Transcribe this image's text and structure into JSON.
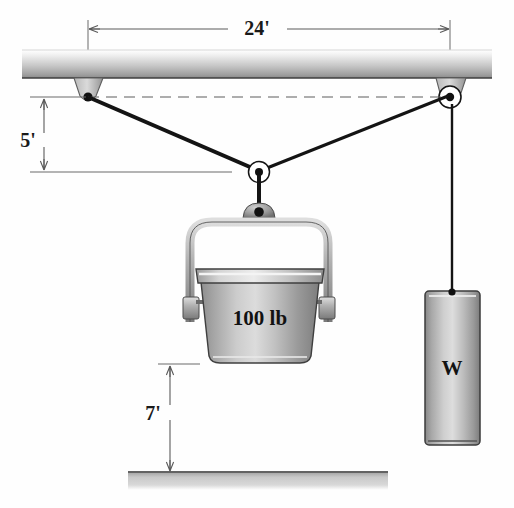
{
  "figure": {
    "type": "engineering-free-body-diagram",
    "background_color": "#fefefe"
  },
  "dimensions": {
    "span": {
      "label": "24'",
      "value": 24,
      "unit": "ft",
      "orientation": "horizontal",
      "from": "left-anchor",
      "to": "right-pulley"
    },
    "sag": {
      "label": "5'",
      "value": 5,
      "unit": "ft",
      "orientation": "vertical",
      "from": "anchor-level",
      "to": "center-pulley-level"
    },
    "clearance": {
      "label": "7'",
      "value": 7,
      "unit": "ft",
      "orientation": "vertical",
      "from": "bucket-bottom",
      "to": "ground"
    }
  },
  "labels": {
    "bucket_weight": "100 lb",
    "counterweight": "W"
  },
  "colors": {
    "beam_light": "#f2f2f2",
    "beam_dark": "#9a9a9a",
    "metal_light": "#e8e8e8",
    "metal_mid": "#9d9d9d",
    "metal_dark": "#6e6e6e",
    "cable": "#141414",
    "ground": "#b8b8b8",
    "dimension_line": "#5a5a5a",
    "text": "#1a1a1a"
  },
  "components": {
    "ceiling_beam": {
      "name": "ceiling beam",
      "y_top": 50,
      "y_bottom": 78
    },
    "left_anchor": {
      "name": "left anchor bracket",
      "x": 88,
      "y": 97
    },
    "right_pulley": {
      "name": "right pulley",
      "x": 450,
      "y": 97
    },
    "center_pulley": {
      "name": "center pulley",
      "x": 259,
      "y": 172
    },
    "bucket": {
      "name": "bucket",
      "label": "100 lb",
      "x_left": 195,
      "x_right": 325,
      "y_top": 268,
      "y_bottom": 363
    },
    "counterweight_block": {
      "name": "counterweight W",
      "label": "W",
      "x_left": 425,
      "x_right": 480,
      "y_top": 290,
      "y_bottom": 445
    },
    "ground_line": {
      "name": "ground",
      "y": 473
    }
  }
}
